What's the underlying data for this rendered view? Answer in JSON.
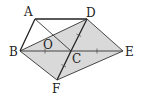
{
  "figure": {
    "type": "geometry",
    "colors": {
      "shade": "#d9d9d9",
      "line": "#222222",
      "background": "#ffffff"
    },
    "points": {
      "A": {
        "label": "A",
        "x": 35,
        "y": 19
      },
      "D": {
        "label": "D",
        "x": 87,
        "y": 19
      },
      "B": {
        "label": "B",
        "x": 20,
        "y": 51
      },
      "C": {
        "label": "C",
        "x": 71,
        "y": 51
      },
      "E": {
        "label": "E",
        "x": 123,
        "y": 51
      },
      "F": {
        "label": "F",
        "x": 57,
        "y": 80
      },
      "O": {
        "label": "O",
        "x": 47,
        "y": 40
      }
    },
    "shaded_polygon": [
      "B",
      "D",
      "E",
      "F"
    ],
    "segments": [
      [
        "A",
        "D"
      ],
      [
        "A",
        "B"
      ],
      [
        "B",
        "C"
      ],
      [
        "C",
        "E"
      ],
      [
        "D",
        "C"
      ],
      [
        "C",
        "F"
      ],
      [
        "A",
        "C"
      ],
      [
        "B",
        "D"
      ],
      [
        "D",
        "E"
      ],
      [
        "B",
        "F"
      ],
      [
        "F",
        "E"
      ]
    ],
    "equal_marks": [
      [
        "B",
        "C"
      ],
      [
        "C",
        "E"
      ],
      [
        "D",
        "C"
      ],
      [
        "C",
        "F"
      ]
    ]
  }
}
